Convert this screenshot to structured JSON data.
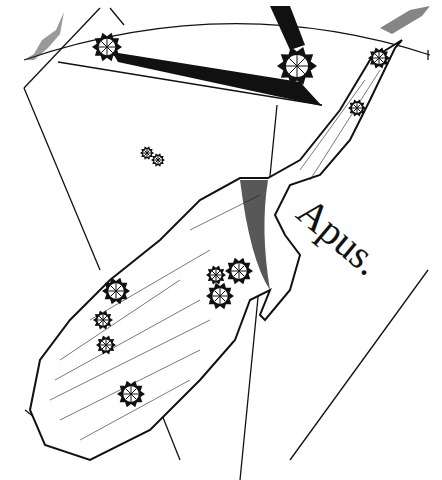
{
  "image": {
    "description": "Engraved celestial atlas plate showing the constellation Apus (bird of paradise) with adjacent constellation outline, star symbols and coordinate lines",
    "constellation_label": "Apus.",
    "colors": {
      "ink": "#111111",
      "paper": "#ffffff"
    }
  },
  "stars": [
    {
      "x": 107,
      "y": 47,
      "r": 15
    },
    {
      "x": 297,
      "y": 66,
      "r": 20
    },
    {
      "x": 379,
      "y": 58,
      "r": 11
    },
    {
      "x": 357,
      "y": 108,
      "r": 9
    },
    {
      "x": 147,
      "y": 153,
      "r": 7
    },
    {
      "x": 158,
      "y": 160,
      "r": 7
    },
    {
      "x": 216,
      "y": 275,
      "r": 10
    },
    {
      "x": 239,
      "y": 271,
      "r": 14
    },
    {
      "x": 220,
      "y": 296,
      "r": 14
    },
    {
      "x": 116,
      "y": 291,
      "r": 14
    },
    {
      "x": 103,
      "y": 320,
      "r": 10
    },
    {
      "x": 106,
      "y": 345,
      "r": 10
    },
    {
      "x": 131,
      "y": 394,
      "r": 14
    }
  ]
}
